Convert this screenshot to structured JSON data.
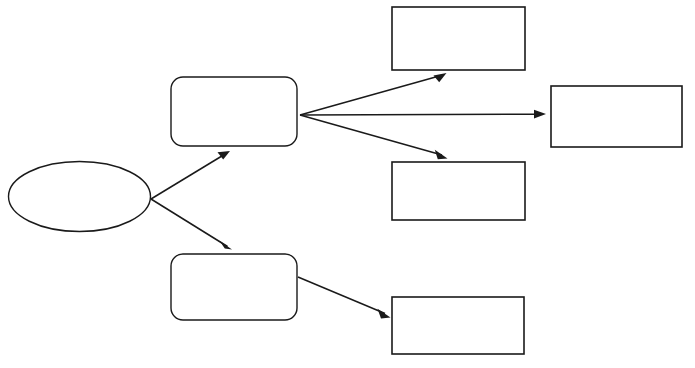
{
  "document": {
    "title": "Flowchart Template",
    "background_color": "#ffffff",
    "stroke_color": "#1a1a1a",
    "width": 695,
    "height": 368
  },
  "diagram": {
    "type": "flowchart",
    "orientation": "left-to-right",
    "node_count": 7,
    "edge_count": 7,
    "all_nodes_blank": true,
    "nodes": [
      {
        "id": "start-ellipse",
        "shape": "ellipse",
        "label": "",
        "cx": 79.5,
        "cy": 196.5,
        "rx": 71.5,
        "ry": 35.5
      },
      {
        "id": "process-upper",
        "shape": "rounded-rectangle",
        "label": "",
        "x": 171,
        "y": 77,
        "width": 126,
        "height": 69,
        "corner_radius": 12
      },
      {
        "id": "process-lower",
        "shape": "rounded-rectangle",
        "label": "",
        "x": 171,
        "y": 254,
        "width": 126,
        "height": 66,
        "corner_radius": 12
      },
      {
        "id": "output-top",
        "shape": "rectangle",
        "label": "",
        "x": 392,
        "y": 7,
        "width": 133,
        "height": 63
      },
      {
        "id": "output-right",
        "shape": "rectangle",
        "label": "",
        "x": 551,
        "y": 86,
        "width": 131,
        "height": 61
      },
      {
        "id": "output-middle",
        "shape": "rectangle",
        "label": "",
        "x": 392,
        "y": 162,
        "width": 133,
        "height": 58
      },
      {
        "id": "output-bottom",
        "shape": "rectangle",
        "label": "",
        "x": 392,
        "y": 297,
        "width": 132,
        "height": 57
      }
    ],
    "edges": [
      {
        "id": "edge-start-to-process-upper",
        "from": "start-ellipse",
        "to": "process-upper",
        "label": "",
        "x1": 151,
        "y1": 199,
        "x2": 228,
        "y2": 152
      },
      {
        "id": "edge-start-to-process-lower",
        "from": "start-ellipse",
        "to": "process-lower",
        "label": "",
        "x1": 151,
        "y1": 199,
        "x2": 230,
        "y2": 249
      },
      {
        "id": "edge-process-upper-to-output-top",
        "from": "process-upper",
        "to": "output-top",
        "label": "",
        "x1": 300,
        "y1": 115,
        "x2": 445,
        "y2": 74
      },
      {
        "id": "edge-process-upper-to-output-right",
        "from": "process-upper",
        "to": "output-right",
        "label": "",
        "x1": 300,
        "y1": 115,
        "x2": 546,
        "y2": 114
      },
      {
        "id": "edge-process-upper-to-output-middle",
        "from": "process-upper",
        "to": "output-middle",
        "label": "",
        "x1": 300,
        "y1": 115,
        "x2": 446,
        "y2": 157
      },
      {
        "id": "edge-process-lower-to-output-bottom",
        "from": "process-lower",
        "to": "output-bottom",
        "label": "",
        "x1": 298,
        "y1": 277,
        "x2": 389,
        "y2": 316
      }
    ]
  }
}
